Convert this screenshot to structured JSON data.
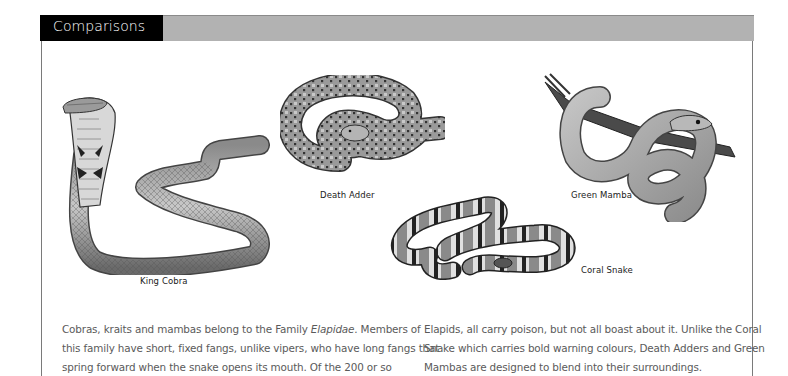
{
  "header": {
    "title": "Comparisons"
  },
  "illustrations": [
    {
      "id": "king-cobra",
      "caption": "King Cobra"
    },
    {
      "id": "death-adder",
      "caption": "Death Adder"
    },
    {
      "id": "green-mamba",
      "caption": "Green Mamba"
    },
    {
      "id": "coral-snake",
      "caption": "Coral Snake"
    }
  ],
  "body": {
    "column1": {
      "line1_before": "Cobras, kraits and mambas belong to the Family ",
      "line1_italic": "Elapidae",
      "line1_after": ". Members of",
      "line2": "this family have short, fixed fangs, unlike vipers, who have long fangs that",
      "line3": "spring forward when the snake opens its mouth. Of the 200 or so"
    },
    "column2": {
      "line1": "Elapids, all carry poison, but not all boast about it. Unlike the Coral",
      "line2": "Snake which carries bold warning colours, Death Adders and Green",
      "line3": "Mambas are designed to blend into their surroundings."
    }
  },
  "colors": {
    "header_tab": "#000000",
    "header_bar": "#b2b2b2",
    "body_text": "#5a5a5a",
    "caption_text": "#222222"
  }
}
